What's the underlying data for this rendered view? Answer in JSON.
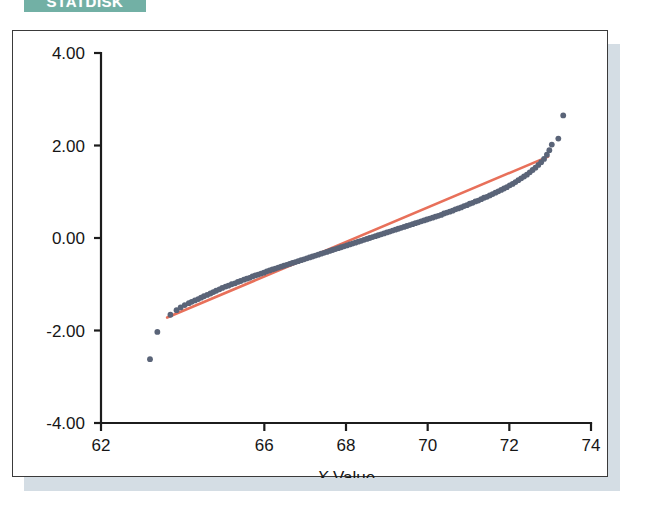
{
  "banner": {
    "label": "STATDISK",
    "color": "#72b0a5",
    "text_color": "#ffffff"
  },
  "card": {
    "background": "#ffffff",
    "border_color": "#3a3a3a",
    "shadow_color": "#ccd7df"
  },
  "chart_data": {
    "type": "scatter",
    "title": "",
    "subtitle": "",
    "xlabel": "X Value",
    "ylabel": "",
    "xlim": [
      62,
      74
    ],
    "ylim": [
      -4.0,
      4.0
    ],
    "xticks": [
      62,
      66,
      68,
      70,
      72,
      74
    ],
    "xticklabels": [
      "62",
      "66",
      "68",
      "70",
      "72",
      "74"
    ],
    "yticks": [
      4.0,
      2.0,
      0.0,
      -2.0,
      -4.0
    ],
    "yticklabels": [
      "4.00",
      "2.00",
      "0.00",
      "-2.00",
      "-4.00"
    ],
    "grid": false,
    "legend": "none",
    "point_color": "#5a6478",
    "point_size": 4,
    "annotations": [
      "Normal quantile-quantile plot: sample quantiles versus theoretical z-scores",
      "Two low outliers near x = 63.2 and x = 63.4",
      "Two high outliers near x = 73.2 and x = 73.3"
    ],
    "series": [
      {
        "name": "Sample quantiles",
        "type": "scatter",
        "color": "#5a6478",
        "x": [
          63.2,
          63.38,
          63.7,
          63.85,
          63.95,
          64.05,
          64.15,
          64.22,
          64.3,
          64.38,
          64.45,
          64.52,
          64.6,
          64.68,
          64.75,
          64.82,
          64.9,
          64.97,
          65.05,
          65.12,
          65.2,
          65.28,
          65.35,
          65.42,
          65.5,
          65.57,
          65.64,
          65.71,
          65.78,
          65.85,
          65.92,
          65.99,
          66.06,
          66.13,
          66.2,
          66.27,
          66.34,
          66.41,
          66.48,
          66.55,
          66.62,
          66.69,
          66.76,
          66.83,
          66.9,
          66.97,
          67.04,
          67.11,
          67.18,
          67.25,
          67.32,
          67.39,
          67.46,
          67.53,
          67.6,
          67.67,
          67.74,
          67.81,
          67.88,
          67.95,
          68.02,
          68.09,
          68.16,
          68.23,
          68.3,
          68.37,
          68.44,
          68.51,
          68.58,
          68.65,
          68.72,
          68.79,
          68.86,
          68.93,
          69.0,
          69.07,
          69.14,
          69.21,
          69.28,
          69.35,
          69.42,
          69.49,
          69.56,
          69.63,
          69.7,
          69.77,
          69.84,
          69.91,
          69.98,
          70.05,
          70.12,
          70.19,
          70.26,
          70.33,
          70.4,
          70.47,
          70.54,
          70.61,
          70.68,
          70.75,
          70.82,
          70.89,
          70.96,
          71.03,
          71.1,
          71.17,
          71.24,
          71.31,
          71.38,
          71.45,
          71.52,
          71.59,
          71.66,
          71.73,
          71.8,
          71.87,
          71.94,
          72.01,
          72.08,
          72.15,
          72.22,
          72.29,
          72.36,
          72.43,
          72.5,
          72.57,
          72.64,
          72.71,
          72.78,
          72.85,
          72.92,
          72.98,
          73.04,
          73.2,
          73.32
        ],
        "y": [
          -2.62,
          -2.03,
          -1.66,
          -1.56,
          -1.5,
          -1.45,
          -1.41,
          -1.38,
          -1.35,
          -1.32,
          -1.29,
          -1.26,
          -1.23,
          -1.2,
          -1.17,
          -1.14,
          -1.11,
          -1.08,
          -1.05,
          -1.03,
          -1.0,
          -0.98,
          -0.95,
          -0.93,
          -0.9,
          -0.88,
          -0.86,
          -0.83,
          -0.81,
          -0.79,
          -0.77,
          -0.75,
          -0.72,
          -0.7,
          -0.68,
          -0.66,
          -0.64,
          -0.62,
          -0.6,
          -0.58,
          -0.56,
          -0.54,
          -0.52,
          -0.5,
          -0.48,
          -0.46,
          -0.44,
          -0.42,
          -0.4,
          -0.38,
          -0.36,
          -0.34,
          -0.32,
          -0.3,
          -0.28,
          -0.26,
          -0.24,
          -0.22,
          -0.2,
          -0.18,
          -0.16,
          -0.14,
          -0.12,
          -0.1,
          -0.08,
          -0.06,
          -0.04,
          -0.02,
          0.0,
          0.02,
          0.04,
          0.06,
          0.08,
          0.1,
          0.12,
          0.14,
          0.16,
          0.18,
          0.2,
          0.22,
          0.24,
          0.26,
          0.28,
          0.3,
          0.32,
          0.34,
          0.36,
          0.38,
          0.4,
          0.42,
          0.44,
          0.46,
          0.48,
          0.5,
          0.53,
          0.55,
          0.57,
          0.59,
          0.62,
          0.64,
          0.66,
          0.69,
          0.71,
          0.74,
          0.76,
          0.79,
          0.81,
          0.84,
          0.87,
          0.89,
          0.92,
          0.95,
          0.98,
          1.01,
          1.04,
          1.07,
          1.1,
          1.14,
          1.17,
          1.21,
          1.25,
          1.29,
          1.33,
          1.37,
          1.42,
          1.47,
          1.52,
          1.58,
          1.64,
          1.71,
          1.8,
          1.9,
          2.02,
          2.15,
          2.65
        ]
      },
      {
        "name": "Reference line",
        "type": "line",
        "color": "#e8705a",
        "x": [
          63.62,
          72.95
        ],
        "y": [
          -1.72,
          1.76
        ]
      }
    ]
  },
  "axis": {
    "x_title": "X Value",
    "x_title_italic_prefix": "X",
    "x_title_rest": " Value"
  }
}
